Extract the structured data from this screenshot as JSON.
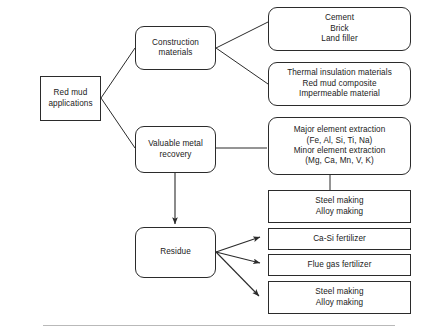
{
  "diagram": {
    "background_color": "#ffffff",
    "line_color": "#2b2b2b",
    "rule_color": "#b9b9b9",
    "nodes": {
      "root": {
        "id": "red-mud-applications",
        "shape": "rectangle",
        "lines": [
          "Red mud",
          "applications"
        ]
      },
      "construction": {
        "id": "construction-materials",
        "shape": "rounded-rectangle",
        "lines": [
          "Construction",
          "materials"
        ]
      },
      "metal_recovery": {
        "id": "valuable-metal-recovery",
        "shape": "rounded-rectangle",
        "lines": [
          "Valuable metal",
          "recovery"
        ]
      },
      "residue": {
        "id": "residue",
        "shape": "rounded-rectangle",
        "lines": [
          "Residue"
        ]
      },
      "building_products": {
        "id": "building-products",
        "shape": "rounded-rectangle",
        "lines": [
          "Cement",
          "Brick",
          "Land filler"
        ]
      },
      "insulation_products": {
        "id": "insulation-products",
        "shape": "rounded-rectangle",
        "lines": [
          "Thermal insulation materials",
          "Red mud composite",
          "Impermeable material"
        ]
      },
      "element_extraction": {
        "id": "element-extraction",
        "shape": "rounded-rectangle",
        "lines": [
          "Major element extraction",
          "(Fe, Al, Si, Ti, Na)",
          "Minor element extraction",
          "(Mg, Ca, Mn, V, K)"
        ]
      },
      "steel_alloy_upper": {
        "id": "steel-alloy-making-upper",
        "shape": "rectangle",
        "lines": [
          "Steel making",
          "Alloy making"
        ]
      },
      "ca_si_fertilizer": {
        "id": "ca-si-fertilizer",
        "shape": "rectangle",
        "lines": [
          "Ca-Si fertilizer"
        ]
      },
      "flue_gas_fertilizer": {
        "id": "flue-gas-fertilizer",
        "shape": "rectangle",
        "lines": [
          "Flue gas fertilizer"
        ]
      },
      "steel_alloy_lower": {
        "id": "steel-alloy-making-lower",
        "shape": "rectangle",
        "lines": [
          "Steel making",
          "Alloy making"
        ]
      }
    },
    "edges": [
      {
        "from": "red-mud-applications",
        "to": "construction-materials",
        "style": "plain-line"
      },
      {
        "from": "red-mud-applications",
        "to": "valuable-metal-recovery",
        "style": "plain-line"
      },
      {
        "from": "construction-materials",
        "to": "building-products",
        "style": "plain-line"
      },
      {
        "from": "construction-materials",
        "to": "insulation-products",
        "style": "plain-line"
      },
      {
        "from": "valuable-metal-recovery",
        "to": "element-extraction",
        "style": "plain-line"
      },
      {
        "from": "valuable-metal-recovery",
        "to": "residue",
        "style": "arrow"
      },
      {
        "from": "element-extraction",
        "to": "steel-alloy-making-upper",
        "style": "plain-line"
      },
      {
        "from": "residue",
        "to": "ca-si-fertilizer",
        "style": "arrow"
      },
      {
        "from": "residue",
        "to": "flue-gas-fertilizer",
        "style": "arrow"
      },
      {
        "from": "residue",
        "to": "steel-alloy-making-lower",
        "style": "arrow"
      }
    ]
  }
}
